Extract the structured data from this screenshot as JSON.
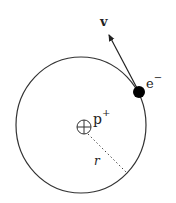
{
  "diagram": {
    "type": "bohr-model-hydrogen",
    "labels": {
      "velocity": "v",
      "electron": "e",
      "electron_charge": "−",
      "proton": "p",
      "proton_charge": "+",
      "radius": "r"
    },
    "colors": {
      "stroke": "#333333",
      "electron_fill": "#000000",
      "background": "#ffffff"
    }
  }
}
